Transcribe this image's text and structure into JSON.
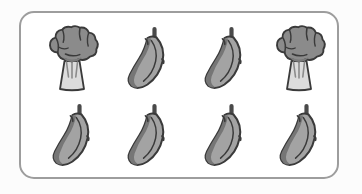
{
  "canvas": {
    "width": 362,
    "height": 194,
    "background_color": "#fcfcfc"
  },
  "panel": {
    "name": "produce-panel",
    "shape": "rounded-rectangle",
    "fill_color": "#ffffff",
    "border_color": "#9d9d9d",
    "border_width": 2,
    "corner_radius": 15
  },
  "palette": {
    "outline": "#3a3a3a",
    "broccoli_head": "#8b8b8b",
    "broccoli_head_shadow": "#7b7b7b",
    "broccoli_stalk": "#dcdcdc",
    "broccoli_stalk_line": "#8b8b8b",
    "banana_body": "#a3a3a3",
    "banana_edge": "#767676",
    "banana_stem": "#4a4a4a"
  },
  "grid": {
    "rows": 2,
    "columns": 4,
    "total_items": 8,
    "counts": {
      "broccoli": 2,
      "banana": 6
    },
    "items": [
      {
        "id": "item-r0c0",
        "type": "broccoli",
        "label": "broccoli-icon",
        "row": 0,
        "column": 0
      },
      {
        "id": "item-r0c1",
        "type": "banana",
        "label": "banana-icon",
        "row": 0,
        "column": 1
      },
      {
        "id": "item-r0c2",
        "type": "banana",
        "label": "banana-icon",
        "row": 0,
        "column": 2
      },
      {
        "id": "item-r0c3",
        "type": "broccoli",
        "label": "broccoli-icon",
        "row": 0,
        "column": 3
      },
      {
        "id": "item-r1c0",
        "type": "banana",
        "label": "banana-icon",
        "row": 1,
        "column": 0
      },
      {
        "id": "item-r1c1",
        "type": "banana",
        "label": "banana-icon",
        "row": 1,
        "column": 1
      },
      {
        "id": "item-r1c2",
        "type": "banana",
        "label": "banana-icon",
        "row": 1,
        "column": 2
      },
      {
        "id": "item-r1c3",
        "type": "banana",
        "label": "banana-icon",
        "row": 1,
        "column": 3
      }
    ]
  }
}
